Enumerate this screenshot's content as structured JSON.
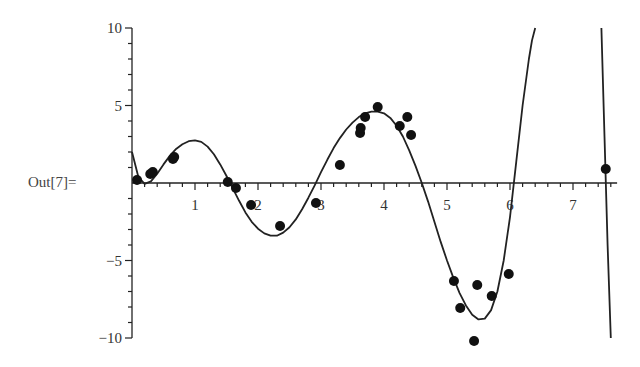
{
  "cell": {
    "output_label": "Out[7]="
  },
  "chart_data": {
    "type": "scatter",
    "title": "",
    "xlabel": "",
    "ylabel": "",
    "xlim": [
      0,
      7.7
    ],
    "ylim": [
      -10,
      10
    ],
    "grid": false,
    "legend": null,
    "x_ticks": [
      1,
      2,
      3,
      4,
      5,
      6,
      7
    ],
    "y_ticks": [
      10,
      5,
      -5,
      -10
    ],
    "series": [
      {
        "name": "data points",
        "kind": "scatter",
        "points": [
          [
            0.08,
            0.19
          ],
          [
            0.29,
            0.58
          ],
          [
            0.33,
            0.71
          ],
          [
            0.65,
            1.55
          ],
          [
            0.67,
            1.68
          ],
          [
            1.52,
            0.06
          ],
          [
            1.65,
            -0.32
          ],
          [
            1.89,
            -1.42
          ],
          [
            2.35,
            -2.77
          ],
          [
            2.92,
            -1.29
          ],
          [
            3.3,
            1.16
          ],
          [
            3.62,
            3.23
          ],
          [
            3.63,
            3.55
          ],
          [
            3.7,
            4.26
          ],
          [
            3.9,
            4.9
          ],
          [
            4.25,
            3.68
          ],
          [
            4.37,
            4.26
          ],
          [
            4.43,
            3.1
          ],
          [
            5.11,
            -6.32
          ],
          [
            5.21,
            -8.06
          ],
          [
            5.48,
            -6.58
          ],
          [
            5.43,
            -10.19
          ],
          [
            5.71,
            -7.29
          ],
          [
            5.98,
            -5.87
          ],
          [
            7.52,
            0.9
          ]
        ]
      },
      {
        "name": "fitted curve",
        "kind": "line",
        "points": [
          [
            0.0,
            2.0
          ],
          [
            0.1,
            0.4
          ],
          [
            0.2,
            -0.05
          ],
          [
            0.3,
            0.1
          ],
          [
            0.4,
            0.6
          ],
          [
            0.5,
            1.2
          ],
          [
            0.6,
            1.75
          ],
          [
            0.7,
            2.2
          ],
          [
            0.8,
            2.5
          ],
          [
            0.9,
            2.7
          ],
          [
            1.0,
            2.75
          ],
          [
            1.1,
            2.65
          ],
          [
            1.2,
            2.35
          ],
          [
            1.3,
            1.85
          ],
          [
            1.4,
            1.2
          ],
          [
            1.5,
            0.45
          ],
          [
            1.6,
            -0.35
          ],
          [
            1.7,
            -1.15
          ],
          [
            1.8,
            -1.9
          ],
          [
            1.9,
            -2.5
          ],
          [
            2.0,
            -2.95
          ],
          [
            2.1,
            -3.25
          ],
          [
            2.2,
            -3.4
          ],
          [
            2.3,
            -3.4
          ],
          [
            2.4,
            -3.2
          ],
          [
            2.5,
            -2.85
          ],
          [
            2.6,
            -2.35
          ],
          [
            2.7,
            -1.7
          ],
          [
            2.8,
            -0.95
          ],
          [
            2.9,
            -0.15
          ],
          [
            3.0,
            0.7
          ],
          [
            3.1,
            1.5
          ],
          [
            3.2,
            2.25
          ],
          [
            3.3,
            2.9
          ],
          [
            3.4,
            3.45
          ],
          [
            3.5,
            3.9
          ],
          [
            3.6,
            4.25
          ],
          [
            3.7,
            4.5
          ],
          [
            3.8,
            4.6
          ],
          [
            3.9,
            4.6
          ],
          [
            4.0,
            4.5
          ],
          [
            4.1,
            4.2
          ],
          [
            4.2,
            3.7
          ],
          [
            4.3,
            3.0
          ],
          [
            4.4,
            2.1
          ],
          [
            4.5,
            1.1
          ],
          [
            4.6,
            0.0
          ],
          [
            4.7,
            -1.2
          ],
          [
            4.8,
            -2.5
          ],
          [
            4.9,
            -3.8
          ],
          [
            5.0,
            -5.0
          ],
          [
            5.1,
            -6.1
          ],
          [
            5.2,
            -7.1
          ],
          [
            5.3,
            -7.9
          ],
          [
            5.4,
            -8.5
          ],
          [
            5.5,
            -8.8
          ],
          [
            5.6,
            -8.75
          ],
          [
            5.7,
            -8.2
          ],
          [
            5.8,
            -7.0
          ],
          [
            5.9,
            -5.0
          ],
          [
            6.0,
            -2.2
          ],
          [
            6.1,
            1.4
          ],
          [
            6.2,
            5.0
          ],
          [
            6.3,
            8.0
          ],
          [
            6.35,
            9.2
          ],
          [
            6.4,
            10.0
          ]
        ],
        "points_right": [
          [
            7.45,
            10.0
          ],
          [
            7.5,
            3.0
          ],
          [
            7.55,
            -4.0
          ],
          [
            7.6,
            -10.0
          ]
        ]
      }
    ]
  }
}
